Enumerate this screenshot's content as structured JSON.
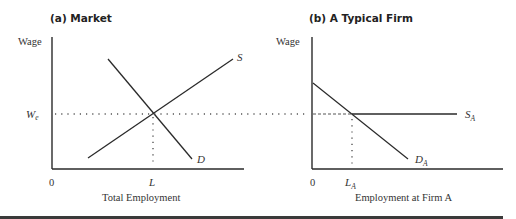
{
  "panels": {
    "market": {
      "title": "(a) Market",
      "y_label": "Wage",
      "x_label": "Total Employment",
      "origin": "0",
      "wage_label": "W",
      "wage_sub": "e",
      "equilibrium_label": "L",
      "supply_label": "S",
      "demand_label": "D"
    },
    "firm": {
      "title": "(b) A Typical Firm",
      "y_label": "Wage",
      "x_label": "Employment at Firm A",
      "origin": "0",
      "equilibrium_label": "L",
      "equilibrium_sub": "A",
      "supply_label": "S",
      "supply_sub": "A",
      "demand_label": "D",
      "demand_sub": "A"
    }
  },
  "colors": {
    "line": "#2a2a2a",
    "guide": "#555555",
    "footer_bar": "#3a3a3a"
  }
}
